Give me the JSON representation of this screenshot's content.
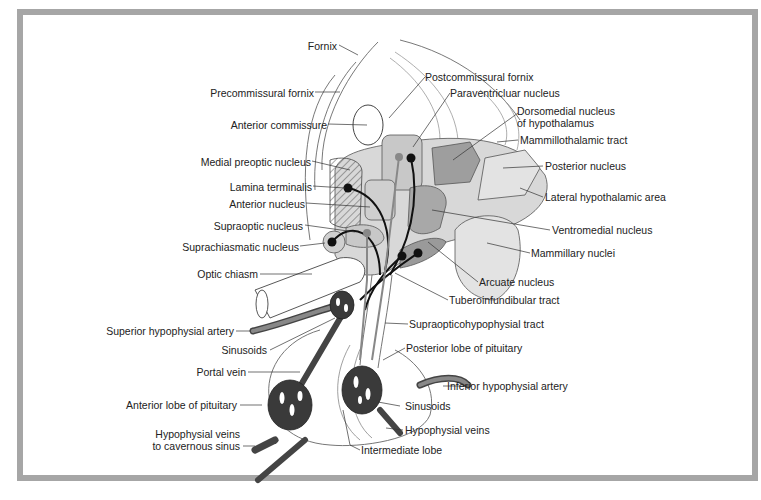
{
  "figure": {
    "frame_color": "#a6a6a6",
    "colors": {
      "light_nucleus": "#d4d4d4",
      "medium_nucleus": "#bdbdbd",
      "dark_nucleus": "#9a9a9a",
      "vessel": "#555555",
      "neuron": "#111111"
    }
  },
  "labels": {
    "fornix": "Fornix",
    "precommissural_fornix": "Precommissural fornix",
    "anterior_commissure": "Anterior commissure",
    "medial_preoptic_nucleus": "Medial preoptic nucleus",
    "lamina_terminalis": "Lamina terminalis",
    "anterior_nucleus": "Anterior nucleus",
    "supraoptic_nucleus": "Supraoptic nucleus",
    "suprachiasmatic_nucleus": "Suprachiasmatic nucleus",
    "optic_chiasm": "Optic chiasm",
    "superior_hypophysial_artery": "Superior hypophysial artery",
    "sinusoids_left": "Sinusoids",
    "portal_vein": "Portal vein",
    "anterior_lobe": "Anterior lobe of pituitary",
    "hypophysial_veins_cav_1": "Hypophysial veins",
    "hypophysial_veins_cav_2": "to cavernous sinus",
    "postcommissural_fornix": "Postcommissural fornix",
    "paraventricular_nucleus": "Paraventricluar nucleus",
    "dorsomedial_1": "Dorsomedial nucleus",
    "dorsomedial_2": "of hypothalamus",
    "mammillothalamic_tract": "Mammillothalamic tract",
    "posterior_nucleus": "Posterior nucleus",
    "lateral_hypothalamic_area": "Lateral hypothalamic area",
    "ventromedial_nucleus": "Ventromedial nucleus",
    "mammillary_nuclei": "Mammillary nuclei",
    "arcuate_nucleus": "Arcuate nucleus",
    "tuberoinfundibular_tract": "Tuberoinfundibular tract",
    "supraopticohypophysial_tract": "Supraopticohypophysial tract",
    "posterior_lobe": "Posterior lobe of pituitary",
    "inferior_hypophysial_artery": "Inferior hypophysial artery",
    "sinusoids_right": "Sinusoids",
    "hypophysial_veins": "Hypophysial veins",
    "intermediate_lobe": "Intermediate lobe"
  }
}
